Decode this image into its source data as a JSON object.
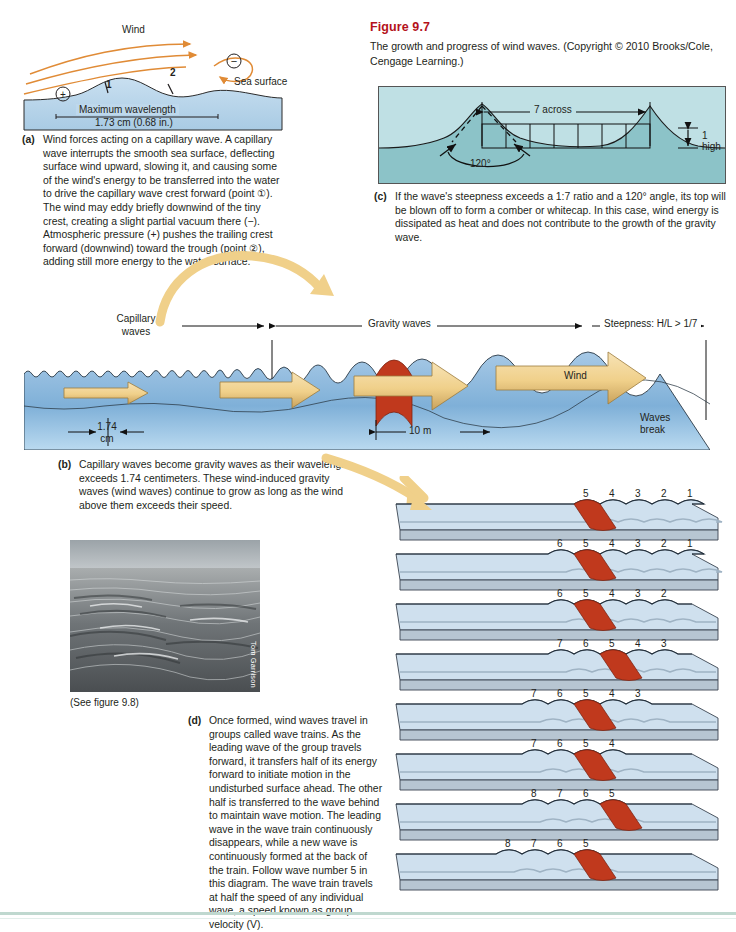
{
  "figure": {
    "number": "Figure 9.7",
    "caption": "The growth and progress of wind waves. (Copyright © 2010 Brooks/Cole, Cengage Learning.)"
  },
  "panel_a": {
    "label": "(a)",
    "text": "Wind forces acting on a capillary wave. A capillary wave interrupts the smooth sea surface, deflecting surface wind upward, slowing it, and causing some of the wind's energy to be transferred into the water to drive the capillary wave crest forward (point ①). The wind may eddy briefly downwind of the tiny crest, creating a slight partial vacuum there (−). Atmospheric pressure (+) pushes the trailing crest forward (downwind) toward the trough (point ②), adding still more energy to the water surface.",
    "diagram": {
      "wind_label": "Wind",
      "sea_surface_label": "Sea surface",
      "plus_symbol": "+",
      "minus_symbol": "−",
      "point_1": "1",
      "point_2": "2",
      "wavelength_label": "Maximum wavelength",
      "wavelength_value": "1.73 cm (0.68 in.)"
    }
  },
  "panel_c": {
    "label": "(c)",
    "text": "If the wave's steepness exceeds a 1:7 ratio and a 120° angle, its top will be blown off to form a comber or whitecap. In this case, wind energy is dissipated as heat and does not contribute to the growth of the gravity wave.",
    "diagram": {
      "across_label": "7 across",
      "high_label": "1 high",
      "angle_label": "120°"
    }
  },
  "panel_b": {
    "label": "(b)",
    "text": "Capillary waves become gravity waves as their wavelength exceeds 1.74 centimeters. These wind-induced gravity waves (wind waves) continue to grow as long as the wind above them exceeds their speed.",
    "diagram": {
      "capillary_label_line1": "Capillary",
      "capillary_label_line2": "waves",
      "gravity_label": "Gravity waves",
      "steepness_label": "Steepness: H/L > 1/7",
      "capillary_width_line1": "1.74",
      "capillary_width_line2": "cm",
      "gravity_width": "10 m",
      "wind_label": "Wind",
      "break_label_line1": "Waves",
      "break_label_line2": "break"
    }
  },
  "panel_d": {
    "label": "(d)",
    "text": "Once formed, wind waves travel in groups called wave trains. As the leading wave of the group travels forward, it transfers half of its energy forward to initiate motion in the undisturbed surface ahead. The other half is transferred to the wave behind to maintain wave motion. The leading wave in the wave train continuously disappears, while a new wave is continuously formed at the back of the train. Follow wave number 5 in this diagram. The wave train travels at half the speed of any individual wave, a speed known as group velocity (V).",
    "wave_trains": [
      {
        "numbers": [
          "5",
          "4",
          "3",
          "2",
          "1"
        ],
        "highlight": "5",
        "highlight_index": 0,
        "start": 0
      },
      {
        "numbers": [
          "6",
          "5",
          "4",
          "3",
          "2",
          "1"
        ],
        "highlight": "5",
        "highlight_index": 1,
        "start": 0
      },
      {
        "numbers": [
          "6",
          "5",
          "4",
          "3",
          "2"
        ],
        "highlight": "5",
        "highlight_index": 1,
        "start": 1
      },
      {
        "numbers": [
          "7",
          "6",
          "5",
          "4",
          "3"
        ],
        "highlight": "5",
        "highlight_index": 2,
        "start": 1
      },
      {
        "numbers": [
          "7",
          "6",
          "5",
          "4",
          "3"
        ],
        "highlight": "5",
        "highlight_index": 2,
        "start": 2
      },
      {
        "numbers": [
          "7",
          "6",
          "5",
          "4"
        ],
        "highlight": "5",
        "highlight_index": 2,
        "start": 3
      },
      {
        "numbers": [
          "8",
          "7",
          "6",
          "5"
        ],
        "highlight": "5",
        "highlight_index": 3,
        "start": 3
      },
      {
        "numbers": [
          "8",
          "7",
          "6",
          "5"
        ],
        "highlight": "5",
        "highlight_index": 3,
        "start": 4
      }
    ]
  },
  "photo": {
    "caption": "(See figure 9.8)",
    "credit": "Tom Garrison"
  },
  "colors": {
    "title_red": "#b4121b",
    "water_light": "#bcd7ea",
    "water_mid": "#8fb9db",
    "teal_light": "#b9dde2",
    "teal_mid": "#8cc3c8",
    "arrow_tan": "#f2d9a4",
    "arrow_orange": "#e8a33d",
    "highlight_red": "#c0391d",
    "wind_line": "#e08b36",
    "block_top": "#cfe0ee",
    "block_side": "#b7c6d2"
  }
}
